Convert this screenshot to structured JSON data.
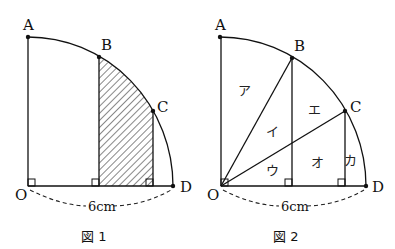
{
  "figure1": {
    "caption": "図 1",
    "points": {
      "A": "A",
      "B": "B",
      "C": "C",
      "O": "O",
      "D": "D"
    },
    "dimension_label": "6cm",
    "shaded_region": "hatched region bounded by B, C, arc and OD"
  },
  "figure2": {
    "caption": "図 2",
    "points": {
      "A": "A",
      "B": "B",
      "C": "C",
      "O": "O",
      "D": "D"
    },
    "dimension_label": "6cm",
    "region_labels": {
      "a": "ア",
      "i": "イ",
      "u": "ウ",
      "e": "エ",
      "o": "オ",
      "ka": "カ"
    }
  },
  "colors": {
    "line": "#111111",
    "background": "#ffffff"
  }
}
